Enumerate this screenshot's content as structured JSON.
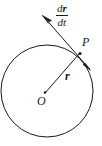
{
  "figure": {
    "type": "geometry-diagram",
    "background_color": "#ffffff",
    "stroke_color": "#1a1a1a",
    "width": 102,
    "height": 146
  },
  "labels": {
    "derivative_numerator_d": "d",
    "derivative_numerator_vector": "r",
    "derivative_denominator_d": "d",
    "derivative_denominator_var": "t",
    "derivative_full": "dr/dt",
    "point_p": "P",
    "vector_r": "r",
    "center_o": "O"
  },
  "geometry": {
    "circle": {
      "center_x": 47,
      "center_y": 91,
      "radius": 46,
      "stroke_width": 1
    },
    "center_dot": {
      "x": 45,
      "y": 93,
      "radius": 1.3
    },
    "point_p": {
      "x": 80,
      "y": 53
    },
    "radius_vector": {
      "from_x": 45,
      "from_y": 93,
      "to_x": 79,
      "to_y": 54,
      "label": "r"
    },
    "tangent_line": {
      "from_x": 43,
      "from_y": 16,
      "to_x": 90,
      "to_y": 70,
      "arrow_head_start": true,
      "arrow_head_end": true,
      "label": "dr/dt"
    }
  }
}
